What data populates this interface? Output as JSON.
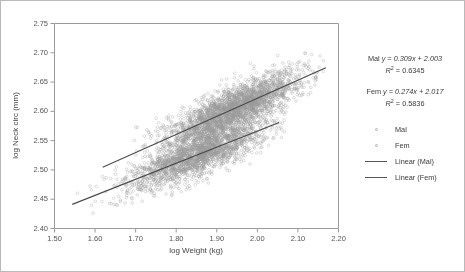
{
  "figure": {
    "background": "#ffffff",
    "border_color": "#b9b9b9"
  },
  "annotations": {
    "male_equation_prefix": "Mal",
    "male_equation": "y = 0.309x + 2.003",
    "male_r2_value": "= 0.6345",
    "female_equation_prefix": "Fem",
    "female_equation": "y = 0.274x + 2.017",
    "female_r2_value": "= 0.5836",
    "r_symbol": "R"
  },
  "legend": {
    "items": [
      {
        "label": "Mal",
        "type": "marker",
        "color": "#b0b0b0"
      },
      {
        "label": "Fem",
        "type": "marker",
        "color": "#b0b0b0"
      },
      {
        "label": "Linear (Mal)",
        "type": "line",
        "color": "#555555"
      },
      {
        "label": "Linear (Fem)",
        "type": "line",
        "color": "#555555"
      }
    ]
  },
  "chart_data": {
    "type": "scatter",
    "title": "",
    "xlabel": "log Weight (kg)",
    "ylabel": "log Neck circ (mm)",
    "xlim": [
      1.5,
      2.2
    ],
    "ylim": [
      2.4,
      2.75
    ],
    "xticks": [
      "1.50",
      "1.60",
      "1.70",
      "1.80",
      "1.90",
      "2.00",
      "2.10",
      "2.20"
    ],
    "xtick_values": [
      1.5,
      1.6,
      1.7,
      1.8,
      1.9,
      2.0,
      2.1,
      2.2
    ],
    "yticks": [
      "2.40",
      "2.45",
      "2.50",
      "2.55",
      "2.60",
      "2.65",
      "2.70",
      "2.75"
    ],
    "ytick_values": [
      2.4,
      2.45,
      2.5,
      2.55,
      2.6,
      2.65,
      2.7,
      2.75
    ],
    "grid": false,
    "legend_position": "right",
    "point_color": "#9a9a9a",
    "point_radius": 1.35,
    "line_color": "#4a4a4a",
    "axis_color": "#9a9a9a",
    "tick_label_color": "#555555",
    "axis_label_color": "#444444",
    "series": [
      {
        "name": "Mal",
        "n_points": 2600,
        "x_mean": 1.945,
        "x_sd": 0.082,
        "x_min": 1.62,
        "x_max": 2.17,
        "slope": 0.309,
        "intercept": 2.003,
        "r2": 0.6345,
        "residual_sd": 0.0182,
        "line_x_start": 1.62,
        "line_x_end": 2.17,
        "seed": 10711
      },
      {
        "name": "Fem",
        "n_points": 2100,
        "x_mean": 1.855,
        "x_sd": 0.086,
        "x_min": 1.545,
        "x_max": 2.07,
        "slope": 0.274,
        "intercept": 2.017,
        "r2": 0.5836,
        "residual_sd": 0.0178,
        "line_x_start": 1.545,
        "line_x_end": 2.055,
        "seed": 20357
      }
    ]
  },
  "plot_geometry": {
    "left": 53,
    "top": 22,
    "right": 337,
    "bottom": 227
  }
}
